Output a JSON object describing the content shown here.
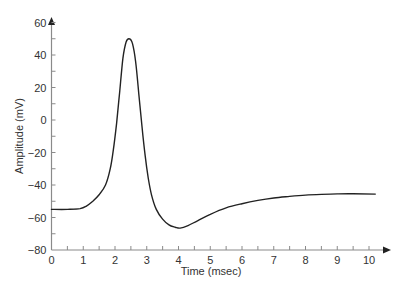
{
  "chart_data": {
    "type": "line",
    "title": "",
    "xlabel": "Time (msec)",
    "ylabel": "Amplitude (mV)",
    "xlim": [
      0,
      10.5
    ],
    "ylim": [
      -80,
      62
    ],
    "grid": false,
    "legend": null,
    "x_ticks": [
      0,
      1,
      2,
      3,
      4,
      5,
      6,
      7,
      8,
      9,
      10
    ],
    "x_tick_labels": [
      "0",
      "1",
      "2",
      "3",
      "4",
      "5",
      "6",
      "7",
      "8",
      "9",
      "10"
    ],
    "x_minor_step": 0.5,
    "y_ticks": [
      -80,
      -60,
      -40,
      -20,
      0,
      20,
      40,
      60
    ],
    "y_tick_labels": [
      "−80",
      "−60",
      "−40",
      "−20",
      "0",
      "20",
      "40",
      "60"
    ],
    "y_minor_step": 10,
    "series": [
      {
        "name": "Action potential",
        "color": "#222222",
        "x": [
          0,
          0.5,
          0.9,
          1.1,
          1.3,
          1.5,
          1.7,
          1.85,
          1.95,
          2.05,
          2.15,
          2.25,
          2.35,
          2.45,
          2.55,
          2.65,
          2.75,
          2.85,
          2.95,
          3.05,
          3.15,
          3.3,
          3.5,
          3.7,
          3.9,
          4.05,
          4.3,
          4.6,
          5.0,
          5.5,
          6.0,
          6.5,
          7.0,
          7.5,
          8.0,
          8.5,
          9.0,
          9.5,
          10.2
        ],
        "y": [
          -55,
          -55,
          -54.5,
          -53,
          -50,
          -46,
          -40,
          -30,
          -18,
          -2,
          18,
          38,
          48,
          50,
          47,
          36,
          16,
          -4,
          -22,
          -36,
          -46,
          -55,
          -61,
          -64.5,
          -66,
          -66.5,
          -65,
          -62,
          -58,
          -54,
          -51.5,
          -49.5,
          -48,
          -47,
          -46.2,
          -45.8,
          -45.5,
          -45.4,
          -45.6
        ]
      }
    ]
  },
  "axis_colors": {
    "axis": "#8a8a8a",
    "curve": "#222222",
    "text": "#333333"
  }
}
